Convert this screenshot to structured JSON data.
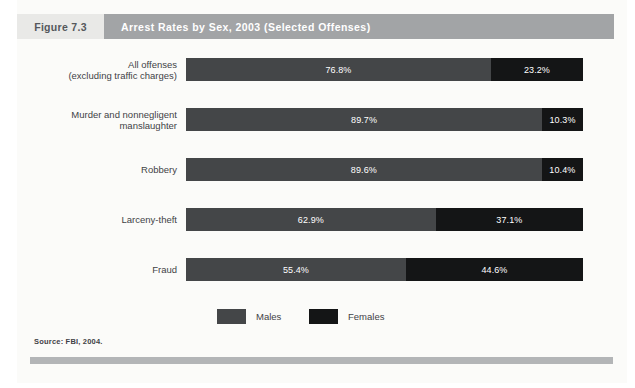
{
  "figure": {
    "number_label": "Figure 7.3",
    "title": "Arrest Rates by Sex, 2003 (Selected Offenses)",
    "source": "Source: FBI, 2004."
  },
  "legend": {
    "items": [
      {
        "label": "Males",
        "color": "#444648",
        "swatch_icon": "legend-swatch-males"
      },
      {
        "label": "Females",
        "color": "#141516",
        "swatch_icon": "legend-swatch-females"
      }
    ]
  },
  "chart_data": {
    "type": "bar",
    "orientation": "horizontal",
    "stacked": true,
    "stacked_total": 100,
    "title": "Arrest Rates by Sex, 2003 (Selected Offenses)",
    "xlabel": "",
    "ylabel": "",
    "xlim": [
      0,
      100
    ],
    "grid": false,
    "legend_position": "bottom-center",
    "value_unit": "percent",
    "categories": [
      "All offenses (excluding traffic charges)",
      "Murder and nonnegligent manslaughter",
      "Robbery",
      "Larceny-theft",
      "Fraud"
    ],
    "category_lines": [
      [
        "All offenses",
        "(excluding traffic charges)"
      ],
      [
        "Murder and nonnegligent",
        "manslaughter"
      ],
      [
        "Robbery"
      ],
      [
        "Larceny-theft"
      ],
      [
        "Fraud"
      ]
    ],
    "series": [
      {
        "name": "Males",
        "color": "#444648",
        "values": [
          76.8,
          89.7,
          89.6,
          62.9,
          55.4
        ],
        "labels": [
          "76.8%",
          "89.7%",
          "89.6%",
          "62.9%",
          "55.4%"
        ]
      },
      {
        "name": "Females",
        "color": "#141516",
        "values": [
          23.2,
          10.3,
          10.4,
          37.1,
          44.6
        ],
        "labels": [
          "23.2%",
          "10.3%",
          "10.4%",
          "37.1%",
          "44.6%"
        ]
      }
    ]
  }
}
